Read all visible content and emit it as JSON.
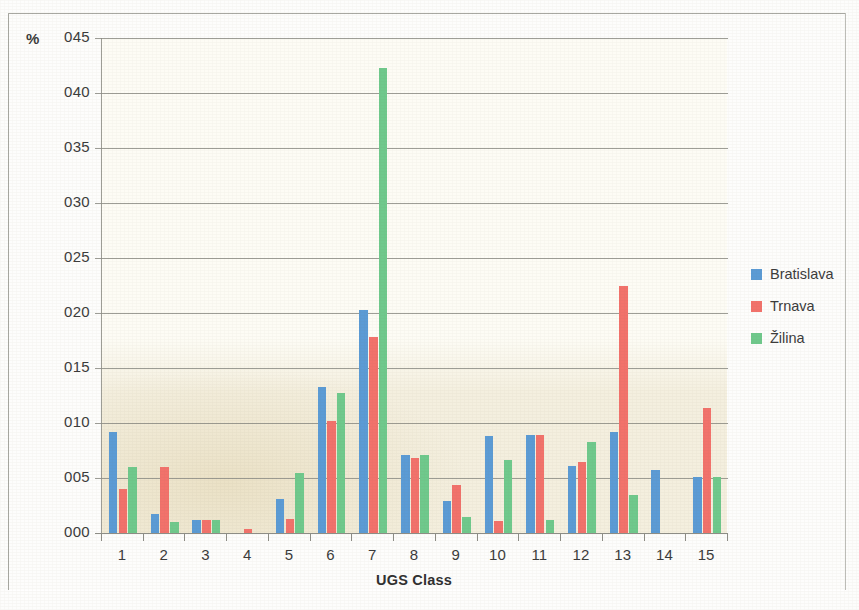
{
  "chart_data": {
    "type": "bar",
    "title": "",
    "xlabel": "UGS Class",
    "ylabel": "%",
    "categories": [
      "1",
      "2",
      "3",
      "4",
      "5",
      "6",
      "7",
      "8",
      "9",
      "10",
      "11",
      "12",
      "13",
      "14",
      "15"
    ],
    "ytick_labels": [
      "000",
      "005",
      "010",
      "015",
      "020",
      "025",
      "030",
      "035",
      "040",
      "045"
    ],
    "ytick_values": [
      0.0,
      0.005,
      0.01,
      0.015,
      0.02,
      0.025,
      0.03,
      0.035,
      0.04,
      0.045
    ],
    "ylim": [
      0,
      0.045
    ],
    "grid": "horizontal",
    "legend_position": "right",
    "series": [
      {
        "name": "Bratislava",
        "color": "#5b9bd5",
        "values": [
          0.0092,
          0.0017,
          0.0012,
          0.0,
          0.0031,
          0.0133,
          0.0203,
          0.0071,
          0.0029,
          0.0088,
          0.0089,
          0.0061,
          0.0092,
          0.0057,
          0.0051
        ]
      },
      {
        "name": "Trnava",
        "color": "#f2726b",
        "values": [
          0.004,
          0.006,
          0.0012,
          0.0004,
          0.0013,
          0.0102,
          0.0178,
          0.0068,
          0.0044,
          0.0011,
          0.0089,
          0.0065,
          0.0225,
          0.0,
          0.0114
        ]
      },
      {
        "name": "Žilina",
        "color": "#6fc98c",
        "values": [
          0.006,
          0.001,
          0.0012,
          0.0,
          0.0055,
          0.0127,
          0.0423,
          0.0071,
          0.0015,
          0.0066,
          0.0012,
          0.0083,
          0.0035,
          0.0,
          0.0051
        ]
      }
    ]
  }
}
